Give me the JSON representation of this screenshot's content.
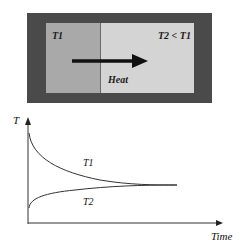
{
  "box": {
    "left_label": "T1",
    "right_label": "T2 < T1",
    "arrow_label": "Heat",
    "colors": {
      "frame": "#4a4a4a",
      "hot": "#a9a9a9",
      "cold": "#d4d4d4"
    }
  },
  "graph": {
    "y_axis_label": "T",
    "x_axis_label": "Time",
    "curves": [
      {
        "name": "T1",
        "label": "T1",
        "trend": "decreasing"
      },
      {
        "name": "T2",
        "label": "T2",
        "trend": "increasing"
      }
    ]
  }
}
